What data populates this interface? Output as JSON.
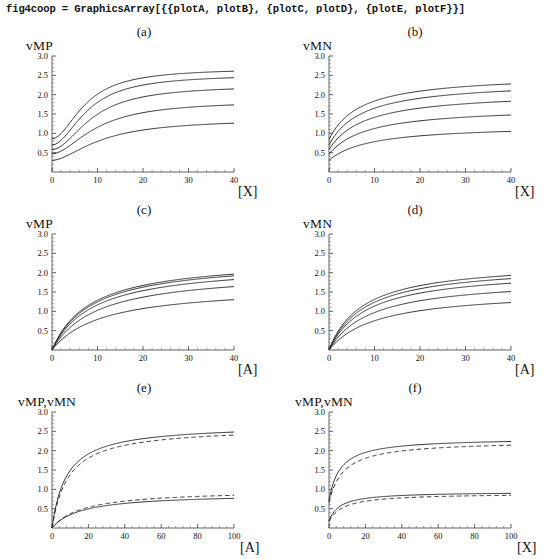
{
  "header": {
    "code": "fig4coop = GraphicsArray[{{plotA, plotB}, {plotC, plotD}, {plotE, plotF}}]"
  },
  "chart_data": [
    {
      "type": "line",
      "panel": "(a)",
      "title": "(a)",
      "ylabel": "vMP",
      "xlabel": "[X]",
      "xlim": [
        0,
        40
      ],
      "ylim": [
        0,
        3.0
      ],
      "xticks": [
        "0",
        "10",
        "20",
        "30",
        "40"
      ],
      "yticks": [
        "0.5",
        "1.0",
        "1.5",
        "2.0",
        "2.5",
        "3.0"
      ],
      "grid": false,
      "legend": "none",
      "shape": "sigmoidal",
      "series": [
        {
          "name": "curve1",
          "style": "solid",
          "y0": 0.86,
          "ymax": 2.68,
          "x_half": 7.5,
          "hill": 1.9
        },
        {
          "name": "curve2",
          "style": "solid",
          "y0": 0.7,
          "ymax": 2.52,
          "x_half": 8.0,
          "hill": 1.9
        },
        {
          "name": "curve3",
          "style": "solid",
          "y0": 0.58,
          "ymax": 2.24,
          "x_half": 9.0,
          "hill": 1.9
        },
        {
          "name": "curve4",
          "style": "solid",
          "y0": 0.47,
          "ymax": 1.84,
          "x_half": 10.0,
          "hill": 1.8
        },
        {
          "name": "curve5",
          "style": "solid",
          "y0": 0.3,
          "ymax": 1.37,
          "x_half": 11.0,
          "hill": 1.7
        }
      ]
    },
    {
      "type": "line",
      "panel": "(b)",
      "title": "(b)",
      "ylabel": "vMN",
      "xlabel": "[X]",
      "xlim": [
        0,
        40
      ],
      "ylim": [
        0,
        3.0
      ],
      "xticks": [
        "0",
        "10",
        "20",
        "30",
        "40"
      ],
      "yticks": [
        "0.5",
        "1.0",
        "1.5",
        "2.0",
        "2.5",
        "3.0"
      ],
      "grid": false,
      "legend": "none",
      "shape": "hyperbolic",
      "series": [
        {
          "name": "curve1",
          "style": "solid",
          "y0": 0.84,
          "ymax": 2.53,
          "km": 7.0
        },
        {
          "name": "curve2",
          "style": "solid",
          "y0": 0.7,
          "ymax": 2.36,
          "km": 7.5
        },
        {
          "name": "curve3",
          "style": "solid",
          "y0": 0.58,
          "ymax": 2.08,
          "km": 8.0
        },
        {
          "name": "curve4",
          "style": "solid",
          "y0": 0.46,
          "ymax": 1.69,
          "km": 8.5
        },
        {
          "name": "curve5",
          "style": "solid",
          "y0": 0.3,
          "ymax": 1.22,
          "km": 9.0
        }
      ]
    },
    {
      "type": "line",
      "panel": "(c)",
      "title": "(c)",
      "ylabel": "vMP",
      "xlabel": "[A]",
      "xlim": [
        0,
        40
      ],
      "ylim": [
        0,
        3.0
      ],
      "xticks": [
        "0",
        "10",
        "20",
        "30",
        "40"
      ],
      "yticks": [
        "0.5",
        "1.0",
        "1.5",
        "2.0",
        "2.5",
        "3.0"
      ],
      "grid": false,
      "legend": "none",
      "shape": "hyperbolic-from-origin",
      "series": [
        {
          "name": "curve1",
          "style": "solid",
          "y0": 0.0,
          "ymax": 2.38,
          "km": 8.5
        },
        {
          "name": "curve2",
          "style": "solid",
          "y0": 0.0,
          "ymax": 2.34,
          "km": 8.8
        },
        {
          "name": "curve3",
          "style": "solid",
          "y0": 0.0,
          "ymax": 2.24,
          "km": 9.2
        },
        {
          "name": "curve4",
          "style": "solid",
          "y0": 0.0,
          "ymax": 2.05,
          "km": 10.0
        },
        {
          "name": "curve5",
          "style": "solid",
          "y0": 0.0,
          "ymax": 1.66,
          "km": 11.0
        }
      ]
    },
    {
      "type": "line",
      "panel": "(d)",
      "title": "(d)",
      "ylabel": "vMN",
      "xlabel": "[A]",
      "xlim": [
        0,
        40
      ],
      "ylim": [
        0,
        3.0
      ],
      "xticks": [
        "0",
        "10",
        "20",
        "30",
        "40"
      ],
      "yticks": [
        "0.5",
        "1.0",
        "1.5",
        "2.0",
        "2.5",
        "3.0"
      ],
      "grid": false,
      "legend": "none",
      "shape": "hyperbolic-from-origin",
      "series": [
        {
          "name": "curve1",
          "style": "solid",
          "y0": 0.0,
          "ymax": 2.29,
          "km": 7.5
        },
        {
          "name": "curve2",
          "style": "solid",
          "y0": 0.0,
          "ymax": 2.21,
          "km": 7.9
        },
        {
          "name": "curve3",
          "style": "solid",
          "y0": 0.0,
          "ymax": 2.09,
          "km": 8.4
        },
        {
          "name": "curve4",
          "style": "solid",
          "y0": 0.0,
          "ymax": 1.86,
          "km": 9.2
        },
        {
          "name": "curve5",
          "style": "solid",
          "y0": 0.0,
          "ymax": 1.55,
          "km": 10.5
        }
      ]
    },
    {
      "type": "line",
      "panel": "(e)",
      "title": "(e)",
      "ylabel": "vMP,vMN",
      "xlabel": "[A]",
      "xlim": [
        0,
        100
      ],
      "ylim": [
        0,
        3.0
      ],
      "xticks": [
        "0",
        "20",
        "40",
        "60",
        "80",
        "100"
      ],
      "yticks": [
        "0.5",
        "1.0",
        "1.5",
        "2.0",
        "2.5",
        "3.0"
      ],
      "grid": false,
      "legend": "none",
      "shape": "hyperbolic-from-origin",
      "series": [
        {
          "name": "upper-solid",
          "style": "solid",
          "y0": 0.0,
          "ymax": 2.68,
          "km": 8.0
        },
        {
          "name": "upper-dashed",
          "style": "dashed",
          "y0": 0.0,
          "ymax": 2.62,
          "km": 9.0
        },
        {
          "name": "lower-dashed",
          "style": "dashed",
          "y0": 0.0,
          "ymax": 0.99,
          "km": 17.0
        },
        {
          "name": "lower-solid",
          "style": "solid",
          "y0": 0.0,
          "ymax": 0.89,
          "km": 16.0
        }
      ]
    },
    {
      "type": "line",
      "panel": "(f)",
      "title": "(f)",
      "ylabel": "vMP,vMN",
      "xlabel": "[X]",
      "xlim": [
        0,
        100
      ],
      "ylim": [
        0,
        3.0
      ],
      "xticks": [
        "0",
        "20",
        "40",
        "60",
        "80",
        "100"
      ],
      "yticks": [
        "0.5",
        "1.0",
        "1.5",
        "2.0",
        "2.5",
        "3.0"
      ],
      "grid": false,
      "legend": "none",
      "shape": "hyperbolic-offset",
      "series": [
        {
          "name": "upper-solid",
          "style": "solid",
          "y0": 0.7,
          "ymax": 2.33,
          "km": 6.0
        },
        {
          "name": "upper-dashed",
          "style": "dashed",
          "y0": 0.66,
          "ymax": 2.26,
          "km": 8.0
        },
        {
          "name": "lower-solid",
          "style": "solid",
          "y0": 0.18,
          "ymax": 0.94,
          "km": 6.0
        },
        {
          "name": "lower-dashed",
          "style": "dashed",
          "y0": 0.17,
          "ymax": 0.9,
          "km": 8.0
        }
      ]
    }
  ]
}
